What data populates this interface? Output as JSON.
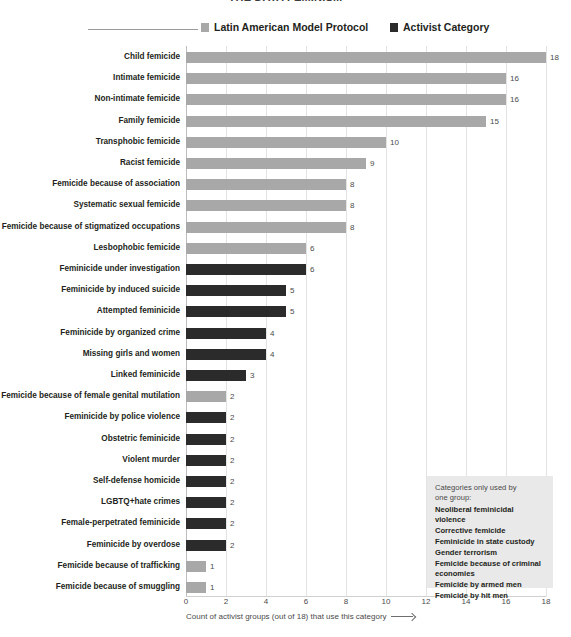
{
  "title": {
    "text": "THE DATA FEMINISM"
  },
  "legend": {
    "items": [
      {
        "label": "Latin American Model Protocol",
        "color": "#a8a8a8",
        "key": "protocol"
      },
      {
        "label": "Activist Category",
        "color": "#2b2b2b",
        "key": "activist"
      }
    ]
  },
  "annotation": {
    "heading": "Categories only used by\none group:",
    "items": [
      "Neoliberal feminicidal violence",
      "Corrective femicide",
      "Feminicide in state custody",
      "Gender terrorism",
      "Femicide because of criminal economies",
      "Femicide by armed men",
      "Femicide by hit men"
    ]
  },
  "chart_data": {
    "type": "bar",
    "orientation": "horizontal",
    "title": "",
    "xlabel": "Count of activist groups (out of 18) that use this category",
    "ylabel": "",
    "xlim": [
      0,
      18
    ],
    "xticks": [
      0,
      2,
      4,
      6,
      8,
      10,
      12,
      14,
      16,
      18
    ],
    "xtick_labels": [
      "0",
      "2",
      "4",
      "6",
      "8",
      "10",
      "12",
      "14",
      "16",
      "18"
    ],
    "grid": true,
    "legend_position": "top",
    "series_names": [
      "Latin American Model Protocol",
      "Activist Category"
    ],
    "series_colors": [
      "#a8a8a8",
      "#2b2b2b"
    ],
    "categories": [
      "Child femicide",
      "Intimate femicide",
      "Non-intimate femicide",
      "Family femicide",
      "Transphobic femicide",
      "Racist femicide",
      "Femicide because of association",
      "Systematic sexual femicide",
      "Femicide because of stigmatized occupations",
      "Lesbophobic femicide",
      "Feminicide under investigation",
      "Feminicide by induced suicide",
      "Attempted feminicide",
      "Feminicide by organized crime",
      "Missing girls and women",
      "Linked feminicide",
      "Femicide because of female genital mutilation",
      "Feminicide by police violence",
      "Obstetric feminicide",
      "Violent murder",
      "Self-defense homicide",
      "LGBTQ+hate crimes",
      "Female-perpetrated feminicide",
      "Feminicide by overdose",
      "Femicide because of trafficking",
      "Femicide because of smuggling"
    ],
    "values": [
      18,
      16,
      16,
      15,
      10,
      9,
      8,
      8,
      8,
      6,
      6,
      5,
      5,
      4,
      4,
      3,
      2,
      2,
      2,
      2,
      2,
      2,
      2,
      2,
      1,
      1
    ],
    "group": [
      "protocol",
      "protocol",
      "protocol",
      "protocol",
      "protocol",
      "protocol",
      "protocol",
      "protocol",
      "protocol",
      "protocol",
      "activist",
      "activist",
      "activist",
      "activist",
      "activist",
      "activist",
      "protocol",
      "activist",
      "activist",
      "activist",
      "activist",
      "activist",
      "activist",
      "activist",
      "protocol",
      "protocol"
    ]
  }
}
